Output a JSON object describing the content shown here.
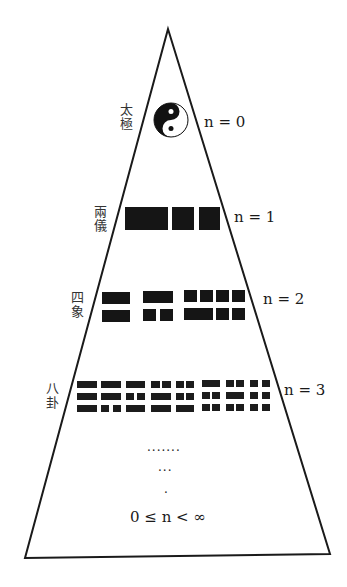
{
  "levels": [
    {
      "label_top": "太",
      "label_bottom": "極",
      "n_label": "n = 0"
    },
    {
      "label_top": "兩",
      "label_bottom": "儀",
      "n_label": "n = 1"
    },
    {
      "label_top": "四",
      "label_bottom": "象",
      "n_label": "n = 2"
    },
    {
      "label_top": "八",
      "label_bottom": "卦",
      "n_label": "n = 3"
    }
  ],
  "ellipsis": {
    "row1": ".......",
    "row2": "...",
    "row3": "."
  },
  "range_label": "0 ≤ n < ∞"
}
